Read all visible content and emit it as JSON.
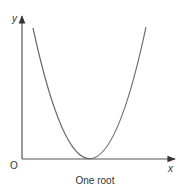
{
  "diagram": {
    "caption": "One root",
    "origin_label": "O",
    "x_axis_label": "x",
    "y_axis_label": "y",
    "curve": "parabola touching x-axis at a single point (one root)",
    "colors": {
      "axis": "#444444",
      "curve": "#666666",
      "text": "#333333",
      "background": "#ffffff"
    }
  }
}
